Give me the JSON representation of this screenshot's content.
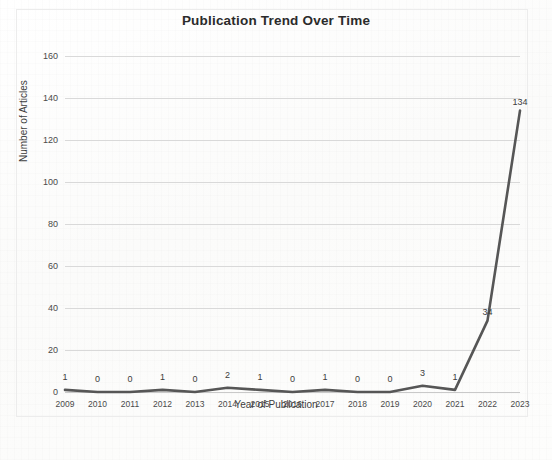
{
  "document": {
    "kind": "scanned-figure",
    "background_color": "#fdfdfd"
  },
  "chart_data": {
    "type": "line",
    "title": "Publication Trend Over Time",
    "xlabel": "Year of Publication",
    "ylabel": "Number of Articles",
    "categories": [
      "2009",
      "2010",
      "2011",
      "2012",
      "2013",
      "2014",
      "2015",
      "2016",
      "2017",
      "2018",
      "2019",
      "2020",
      "2021",
      "2022",
      "2023"
    ],
    "values": [
      1,
      0,
      0,
      1,
      0,
      2,
      1,
      0,
      1,
      0,
      0,
      3,
      1,
      34,
      134
    ],
    "series": [
      {
        "name": "Number of Articles",
        "values": [
          1,
          0,
          0,
          1,
          0,
          2,
          1,
          0,
          1,
          0,
          0,
          3,
          1,
          34,
          134
        ],
        "color": "#565656"
      }
    ],
    "data_labels": [
      "1",
      "0",
      "0",
      "1",
      "0",
      "2",
      "1",
      "0",
      "1",
      "0",
      "0",
      "3",
      "1",
      "34",
      "134"
    ],
    "ylim": [
      0,
      160
    ],
    "yticks": [
      0,
      20,
      40,
      60,
      80,
      100,
      120,
      140,
      160
    ],
    "ytick_labels": [
      "0",
      "20",
      "40",
      "60",
      "80",
      "100",
      "120",
      "140",
      "160"
    ],
    "grid": true,
    "grid_color": "#d9d9d9",
    "legend": false,
    "legend_position": "none",
    "line_color": "#565656",
    "markers": false
  }
}
